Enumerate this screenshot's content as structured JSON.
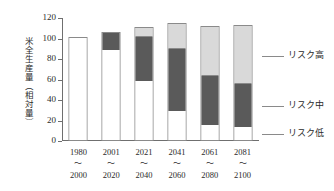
{
  "chart_data": {
    "type": "bar",
    "subtype": "stacked-bar",
    "title": "",
    "xlabel": "",
    "ylabel": "米全生産量（相対量）",
    "ylim": [
      0,
      120
    ],
    "yticks": [
      0,
      20,
      40,
      60,
      80,
      100,
      120
    ],
    "ytick_labels": [
      "0",
      "20",
      "40",
      "60",
      "80",
      "100",
      "120"
    ],
    "grid": false,
    "legend_position": "right",
    "categories": [
      "1980〜2000",
      "2001〜2020",
      "2021〜2040",
      "2041〜2060",
      "2061〜2080",
      "2081〜2100"
    ],
    "category_parts": [
      {
        "start": "1980",
        "dash": "〜",
        "end": "2000"
      },
      {
        "start": "2001",
        "dash": "〜",
        "end": "2020"
      },
      {
        "start": "2021",
        "dash": "〜",
        "end": "2040"
      },
      {
        "start": "2041",
        "dash": "〜",
        "end": "2060"
      },
      {
        "start": "2061",
        "dash": "〜",
        "end": "2080"
      },
      {
        "start": "2081",
        "dash": "〜",
        "end": "2100"
      }
    ],
    "series": [
      {
        "name": "リスク低",
        "key": "low",
        "color": "#ffffff",
        "values": [
          100,
          88,
          58,
          28,
          15,
          13
        ]
      },
      {
        "name": "リスク中",
        "key": "mid",
        "color": "#5a5a5a",
        "values": [
          0,
          16,
          43,
          61,
          47,
          42
        ]
      },
      {
        "name": "リスク高",
        "key": "high",
        "color": "#d9d9d9",
        "values": [
          0,
          0,
          7,
          23,
          47,
          55
        ]
      }
    ],
    "totals": [
      100,
      104,
      108,
      112,
      109,
      110
    ]
  },
  "legend": {
    "items": [
      {
        "label": "リスク高",
        "key": "high"
      },
      {
        "label": "リスク中",
        "key": "mid"
      },
      {
        "label": "リスク低",
        "key": "low"
      }
    ]
  },
  "axis": {
    "y_label_text": "米全生産量（相対量）"
  }
}
